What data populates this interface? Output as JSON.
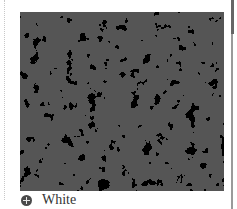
{
  "swatch": {
    "name": "White",
    "pattern": "granite-speckle",
    "colors": {
      "base": "#555555",
      "speckle": "#d9d9d9"
    }
  },
  "option": {
    "icon": "plus-circle-icon",
    "label": "White"
  }
}
